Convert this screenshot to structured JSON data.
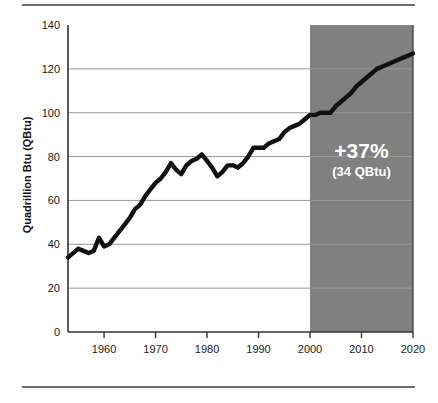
{
  "chart_data": {
    "type": "line",
    "title": "",
    "xlabel": "",
    "ylabel": "Quadrillion Btu (QBtu)",
    "xlim": [
      1953,
      2020
    ],
    "ylim": [
      0,
      140
    ],
    "xticks": [
      1960,
      1970,
      1980,
      1990,
      2000,
      2010,
      2020
    ],
    "yticks": [
      0,
      20,
      40,
      60,
      80,
      100,
      120,
      140
    ],
    "grid": "horizontal",
    "legend": "none",
    "series": [
      {
        "name": "Total energy consumption",
        "x": [
          1953,
          1954,
          1955,
          1956,
          1957,
          1958,
          1959,
          1960,
          1961,
          1962,
          1963,
          1964,
          1965,
          1966,
          1967,
          1968,
          1969,
          1970,
          1971,
          1972,
          1973,
          1974,
          1975,
          1976,
          1977,
          1978,
          1979,
          1980,
          1981,
          1982,
          1983,
          1984,
          1985,
          1986,
          1987,
          1988,
          1989,
          1990,
          1991,
          1992,
          1993,
          1994,
          1995,
          1996,
          1997,
          1998,
          1999,
          2000,
          2001,
          2002,
          2003,
          2004,
          2005,
          2006,
          2007,
          2008,
          2009,
          2010,
          2011,
          2012,
          2013,
          2014,
          2015,
          2016,
          2017,
          2018,
          2019,
          2020
        ],
        "y": [
          34,
          36,
          38,
          37,
          36,
          37,
          43,
          39,
          40,
          43,
          46,
          49,
          52,
          56,
          58,
          62,
          65,
          68,
          70,
          73,
          77,
          74,
          72,
          76,
          78,
          79,
          81,
          78,
          75,
          71,
          73,
          76,
          76,
          75,
          77,
          80,
          84,
          84,
          84,
          86,
          87,
          88,
          91,
          93,
          94,
          95,
          97,
          99,
          99,
          100,
          100,
          100,
          103,
          105,
          107,
          109,
          112,
          114,
          116,
          118,
          120,
          121,
          122,
          123,
          124,
          125,
          126,
          127
        ]
      }
    ],
    "shaded_region": {
      "label": "projection",
      "x_start": 2000,
      "x_end": 2020,
      "color": "#808080"
    },
    "annotations": [
      {
        "name": "growth-annotation",
        "main": "+37%",
        "sub": "(34 QBtu)",
        "x": 2010,
        "y": 80,
        "color": "#ffffff"
      }
    ],
    "colors": {
      "line": "#111111",
      "grid": "#9a9a9a",
      "axis": "#333333",
      "shade": "#808080",
      "background": "#ffffff",
      "rule": "#6f6f6f"
    }
  }
}
